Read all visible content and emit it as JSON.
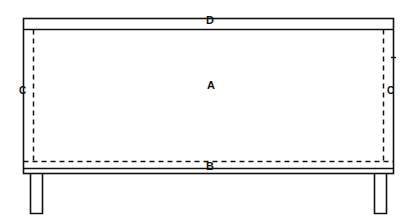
{
  "figure": {
    "type": "patent-line-drawing",
    "view": "front elevation",
    "background_color": "#ffffff",
    "line_color": "#111111",
    "canvas": {
      "width": 417,
      "height": 223
    },
    "labels": [
      {
        "id": "A",
        "text": "A",
        "x": 212,
        "y": 86,
        "refers_to": "main panel / front face"
      },
      {
        "id": "B",
        "text": "B",
        "x": 211,
        "y": 167,
        "refers_to": "lower rail / bottom edge"
      },
      {
        "id": "C-left",
        "text": "C",
        "x": 23,
        "y": 91,
        "refers_to": "left hidden edge (dashed)"
      },
      {
        "id": "C-right",
        "text": "C",
        "x": 391,
        "y": 91,
        "refers_to": "right hidden edge (dashed)"
      },
      {
        "id": "D",
        "text": "D",
        "x": 211,
        "y": 21,
        "refers_to": "top rail / top edge"
      }
    ],
    "geometry": {
      "outer_frame": {
        "x": 23,
        "y": 18,
        "width": 371,
        "height": 156
      },
      "top_rail": {
        "x": 23,
        "y": 18,
        "width": 371,
        "height": 11
      },
      "bottom_rail": {
        "x": 23,
        "y": 168,
        "width": 371,
        "height": 6
      },
      "left_leg": {
        "x": 30,
        "y": 174,
        "width": 12,
        "height": 40
      },
      "right_leg": {
        "x": 375,
        "y": 174,
        "width": 12,
        "height": 40
      },
      "dashed_vertical_left": {
        "x": 33,
        "y1": 29,
        "y2": 163
      },
      "dashed_vertical_right": {
        "x": 384,
        "y1": 29,
        "y2": 163
      },
      "dashed_horizontal": {
        "y": 161,
        "x1": 23,
        "x2": 394
      },
      "right_edge_tick": {
        "x": 394,
        "y": 57
      }
    },
    "line_styles": {
      "solid_weight_px": 1.6,
      "dash_pattern": "5 4"
    }
  }
}
